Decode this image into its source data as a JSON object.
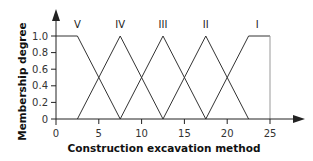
{
  "chart_data": {
    "type": "line",
    "title": "",
    "xlabel": "Construction excavation method",
    "ylabel": "Membership degree",
    "xlim": [
      0,
      25
    ],
    "ylim": [
      0,
      1.0
    ],
    "grid": false,
    "legend": "none (series labeled inline above peaks)",
    "x_ticks": [
      0,
      5,
      10,
      15,
      20,
      25
    ],
    "x_tick_labels": [
      "0",
      "5",
      "10",
      "15",
      "20",
      "25"
    ],
    "y_ticks": [
      0,
      0.2,
      0.4,
      0.6,
      0.8,
      1.0
    ],
    "y_tick_labels": [
      "0",
      "0.2",
      "0.4",
      "0.6",
      "0.8",
      "1.0"
    ],
    "series": [
      {
        "name": "V",
        "x": [
          0,
          2.5,
          7.5
        ],
        "y": [
          1.0,
          1.0,
          0
        ],
        "label_x": 2.5
      },
      {
        "name": "IV",
        "x": [
          2.5,
          7.5,
          12.5
        ],
        "y": [
          0,
          1.0,
          0
        ],
        "label_x": 7.5
      },
      {
        "name": "III",
        "x": [
          7.5,
          12.5,
          17.5
        ],
        "y": [
          0,
          1.0,
          0
        ],
        "label_x": 12.5
      },
      {
        "name": "II",
        "x": [
          12.5,
          17.5,
          22.5
        ],
        "y": [
          0,
          1.0,
          0
        ],
        "label_x": 17.5
      },
      {
        "name": "I",
        "x": [
          17.5,
          22.5,
          25,
          25
        ],
        "y": [
          0,
          1.0,
          1.0,
          0
        ],
        "label_x": 23.5
      }
    ],
    "colors": {
      "line": "#333333",
      "axis": "#222222",
      "right_edge": "#999999"
    }
  }
}
